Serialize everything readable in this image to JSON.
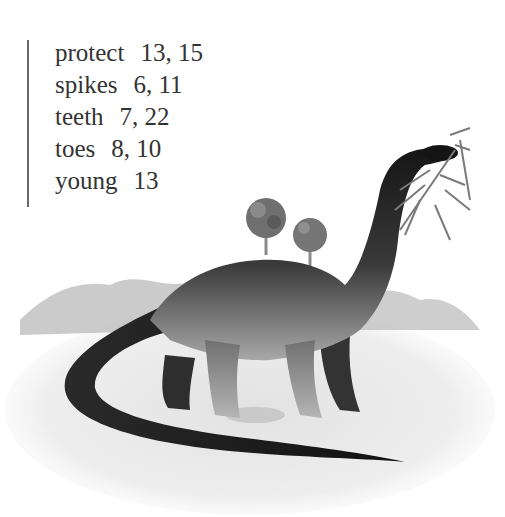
{
  "index": {
    "entries": [
      {
        "term": "protect",
        "pages": "13, 15"
      },
      {
        "term": "spikes",
        "pages": "6, 11"
      },
      {
        "term": "teeth",
        "pages": "7, 22"
      },
      {
        "term": "toes",
        "pages": "8, 10"
      },
      {
        "term": "young",
        "pages": "13"
      }
    ]
  },
  "illustration": {
    "subject": "long-necked sauropod dinosaur eating leaves",
    "colors": {
      "body_dark": "#1a1a1a",
      "body_light": "#9a9a9a",
      "ground": "#e6e6e6",
      "foliage": "#7a7a7a"
    }
  }
}
